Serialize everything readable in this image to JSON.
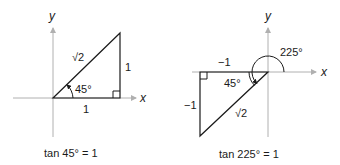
{
  "diagrams": [
    {
      "name": "quadrant-I-triangle",
      "axis_labels": {
        "x": "x",
        "y": "y"
      },
      "angle_label": "45°",
      "hypotenuse_label": "√2",
      "adjacent_label": "1",
      "opposite_label": "1",
      "caption": "tan 45° = 1"
    },
    {
      "name": "quadrant-III-triangle",
      "axis_labels": {
        "x": "x",
        "y": "y"
      },
      "rotation_angle_label": "225°",
      "reference_angle_label": "45°",
      "hypotenuse_label": "√2",
      "adjacent_label": "−1",
      "opposite_label": "−1",
      "caption": "tan 225° = 1"
    }
  ],
  "colors": {
    "axis": "#b0b0b0",
    "line": "#1a1a1a",
    "text": "#1a1a1a"
  }
}
